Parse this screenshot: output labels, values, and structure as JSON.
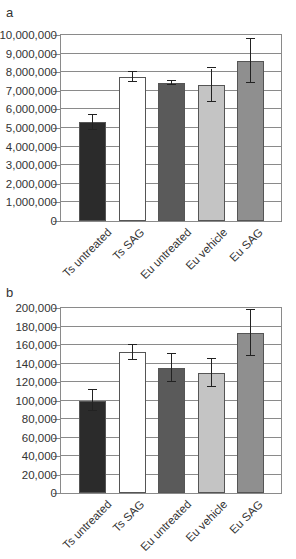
{
  "chart_data": [
    {
      "panel": "a",
      "type": "bar",
      "title": "",
      "xlabel": "",
      "ylabel": "",
      "categories": [
        "Ts untreated",
        "Ts SAG",
        "Eu untreated",
        "Eu vehicle",
        "Eu SAG"
      ],
      "values": [
        5300000,
        7750000,
        7420000,
        7300000,
        8600000
      ],
      "error": [
        400000,
        250000,
        120000,
        900000,
        1200000
      ],
      "colors": [
        "#2b2b2b",
        "#ffffff",
        "#5a5a5a",
        "#c4c4c4",
        "#8f8f8f"
      ],
      "ylim": [
        0,
        10000000
      ],
      "yticks": [
        "0",
        "1,000,000",
        "2,000,000",
        "3,000,000",
        "4,000,000",
        "5,000,000",
        "6,000,000",
        "7,000,000",
        "8,000,000",
        "9,000,000",
        "10,000,000"
      ],
      "grid": true,
      "legend": null
    },
    {
      "panel": "b",
      "type": "bar",
      "title": "",
      "xlabel": "",
      "ylabel": "",
      "categories": [
        "Ts untreated",
        "Ts SAG",
        "Eu untreated",
        "Eu vehicle",
        "Eu SAG"
      ],
      "values": [
        100000,
        152000,
        135000,
        130000,
        173000
      ],
      "error": [
        11000,
        8000,
        15000,
        15000,
        25000
      ],
      "colors": [
        "#2b2b2b",
        "#ffffff",
        "#5a5a5a",
        "#c4c4c4",
        "#8f8f8f"
      ],
      "ylim": [
        0,
        200000
      ],
      "yticks": [
        "0",
        "20,000",
        "40,000",
        "60,000",
        "80,000",
        "100,000",
        "120,000",
        "140,000",
        "160,000",
        "180,000",
        "200,000"
      ],
      "grid": true,
      "legend": null
    }
  ],
  "panels": {
    "a": {
      "label": "a"
    },
    "b": {
      "label": "b"
    }
  }
}
